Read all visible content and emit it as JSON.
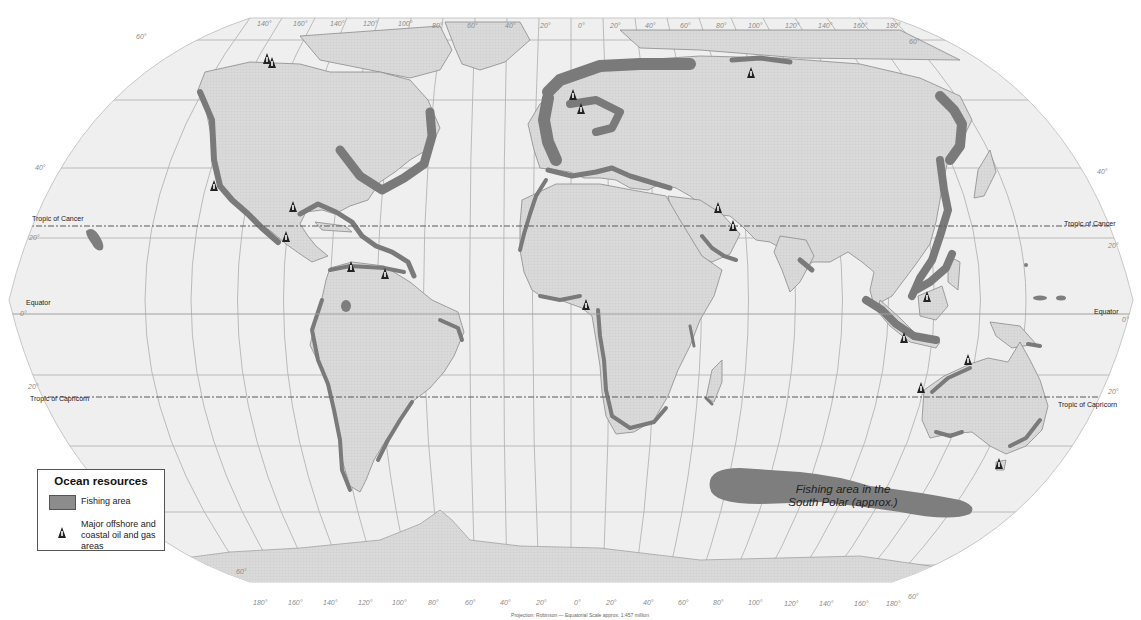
{
  "map": {
    "projection_caption": "Projection: Robinson — Equatorial Scale approx. 1:457 million",
    "lines": {
      "tropic_of_cancer": "Tropic of Cancer",
      "equator": "Equator",
      "tropic_of_capricorn": "Tropic of Capricorn"
    },
    "annotation": {
      "south_polar_line1": "Fishing area in the",
      "south_polar_line2": "South Polar (approx.)"
    },
    "latitude_labels": {
      "n60_left": "60°",
      "n40_left": "40°",
      "n20_left": "20°",
      "eq_left": "0°",
      "s20_left": "20°",
      "s40_left": "40°",
      "n60_right": "60°",
      "n40_right": "40°",
      "n20_right": "20°",
      "eq_right": "0°",
      "s20_right": "20°",
      "s40_right": "40°",
      "s60_right": "60°",
      "s60_left": "60°"
    },
    "longitude_labels_top": [
      "140°",
      "160°",
      "140°",
      "120°",
      "100°",
      "80°",
      "60°",
      "40°",
      "20°",
      "0°",
      "20°",
      "40°",
      "60°",
      "80°",
      "100°",
      "120°",
      "140°",
      "160°",
      "180°"
    ],
    "longitude_labels_bottom": [
      "180°",
      "160°",
      "140°",
      "120°",
      "100°",
      "80°",
      "60°",
      "40°",
      "20°",
      "0°",
      "20°",
      "40°",
      "60°",
      "80°",
      "100°",
      "120°",
      "140°",
      "160°",
      "180°"
    ],
    "oil_gas_sites": [
      {
        "name": "North Alaska (west)",
        "x": 267,
        "y": 56
      },
      {
        "name": "North Alaska (Prudhoe)",
        "x": 272,
        "y": 60
      },
      {
        "name": "California",
        "x": 214,
        "y": 183
      },
      {
        "name": "Gulf of Mexico",
        "x": 293,
        "y": 204
      },
      {
        "name": "Mexico (Bay of Campeche)",
        "x": 286,
        "y": 234
      },
      {
        "name": "Venezuela (Maracaibo)",
        "x": 351,
        "y": 264
      },
      {
        "name": "Trinidad",
        "x": 385,
        "y": 271
      },
      {
        "name": "North Sea (Norway)",
        "x": 573,
        "y": 92
      },
      {
        "name": "North Sea (UK)",
        "x": 581,
        "y": 106
      },
      {
        "name": "West Siberia / Kara Sea",
        "x": 751,
        "y": 70
      },
      {
        "name": "Persian Gulf (north)",
        "x": 718,
        "y": 205
      },
      {
        "name": "Persian Gulf (south)",
        "x": 733,
        "y": 223
      },
      {
        "name": "Gulf of Guinea (Nigeria)",
        "x": 586,
        "y": 302
      },
      {
        "name": "Brunei / Borneo",
        "x": 927,
        "y": 294
      },
      {
        "name": "Java Sea",
        "x": 904,
        "y": 335
      },
      {
        "name": "Timor Sea",
        "x": 968,
        "y": 357
      },
      {
        "name": "North West Shelf",
        "x": 921,
        "y": 385
      },
      {
        "name": "Bass Strait",
        "x": 999,
        "y": 461
      }
    ]
  },
  "legend": {
    "title": "Ocean resources",
    "items": [
      {
        "label": "Fishing area",
        "swatch_color": "#8c8c8c"
      },
      {
        "label": "Major offshore and coastal oil and gas areas",
        "icon": "oil-rig-icon"
      }
    ]
  },
  "colors": {
    "ocean": "#efefef",
    "land": "#dcdcdc",
    "fishing_area": "#7e7e7e",
    "oil_marker": "#222222"
  }
}
